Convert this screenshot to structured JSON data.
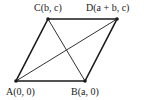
{
  "diagram": {
    "type": "parallelogram with diagonals",
    "points": {
      "A": {
        "label": "A(0, 0)",
        "x": 16,
        "y": 81
      },
      "B": {
        "label": "B(a, 0)",
        "x": 85,
        "y": 81
      },
      "C": {
        "label": "C(b, c)",
        "x": 48,
        "y": 19
      },
      "D": {
        "label": "D(a + b, c)",
        "x": 117,
        "y": 19
      }
    },
    "edges": [
      [
        "A",
        "B"
      ],
      [
        "B",
        "D"
      ],
      [
        "D",
        "C"
      ],
      [
        "C",
        "A"
      ]
    ],
    "diagonals": [
      [
        "A",
        "D"
      ],
      [
        "C",
        "B"
      ]
    ],
    "colors": {
      "line": "#1a1a1a",
      "point": "#1a1a1a"
    }
  }
}
